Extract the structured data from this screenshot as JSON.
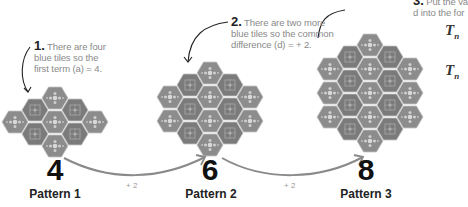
{
  "notes": [
    {
      "num": "1.",
      "lines": [
        "There are four",
        "blue tiles so the",
        "first term (a) = 4."
      ]
    },
    {
      "num": "2.",
      "lines": [
        "There are two more",
        "blue tiles so the common",
        "difference (d) = + 2."
      ]
    },
    {
      "num": "3.",
      "lines": [
        "Put the va",
        "d into the for"
      ]
    }
  ],
  "patterns": [
    {
      "count": "4",
      "label": "Pattern 1",
      "tiles": 7,
      "blue_tiles": 4
    },
    {
      "count": "6",
      "label": "Pattern 2",
      "tiles": 12,
      "blue_tiles": 6
    },
    {
      "count": "8",
      "label": "Pattern 3",
      "tiles": 19,
      "blue_tiles": 8
    }
  ],
  "steps": [
    "+ 2",
    "+ 2"
  ],
  "formula": {
    "lines": [
      "T",
      "T"
    ],
    "subscript": "n"
  },
  "colors": {
    "tile": "#8c8c8c",
    "tile_dark": "#7a7a7a",
    "tile_edge": "#bdbdbd",
    "arrow": "#888888"
  }
}
